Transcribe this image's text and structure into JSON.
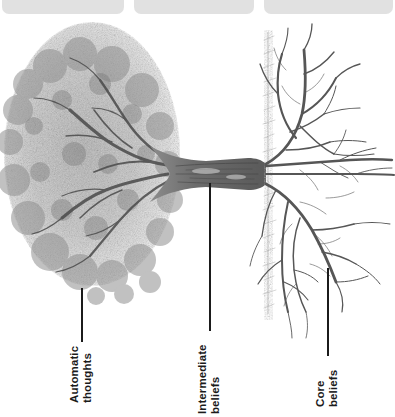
{
  "page": {
    "background_color": "#ffffff",
    "ink_color": "#1b1b1b"
  },
  "top_cards": [
    {
      "id": "top-card-1",
      "ghost_text": "",
      "left": 2,
      "width": 122,
      "color": "#dcdcdc"
    },
    {
      "id": "top-card-2",
      "ghost_text": "",
      "left": 134,
      "width": 120,
      "color": "#dcdcdc"
    },
    {
      "id": "top-card-3",
      "ghost_text": "",
      "left": 264,
      "width": 129,
      "color": "#dcdcdc"
    }
  ],
  "illustration": {
    "name": "pencil-sketch-tree-rotated",
    "description": "Graphite sketch of a tree rotated 90 degrees: dense canopy on the left, horizontal trunk in the middle, root system spreading to the right, with a vertical ground line between trunk and roots.",
    "canopy_color": "#8e8e8e",
    "trunk_color": "#6e6e6e",
    "root_color": "#5f5f5f",
    "ground_line_color": "#8a8a8a"
  },
  "callouts": [
    {
      "id": "callout-automatic-thoughts",
      "label": "Automatic\nthoughts",
      "line": {
        "x": 81,
        "y_top": 288,
        "height": 54
      },
      "text": {
        "x": 68,
        "y": 403
      }
    },
    {
      "id": "callout-intermediate-beliefs",
      "label": "Intermediate\nbeliefs",
      "line": {
        "x": 209,
        "y_top": 183,
        "height": 148
      },
      "text": {
        "x": 196,
        "y": 414
      }
    },
    {
      "id": "callout-core-beliefs",
      "label": "Core\nbeliefs",
      "line": {
        "x": 327,
        "y_top": 268,
        "height": 88
      },
      "text": {
        "x": 314,
        "y": 407
      }
    }
  ]
}
